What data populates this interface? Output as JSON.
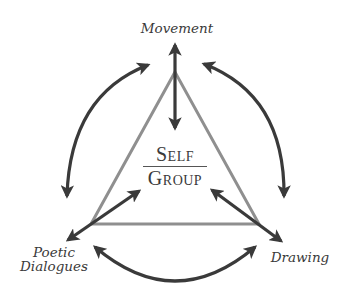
{
  "diagram": {
    "type": "triangle-cycle",
    "center": {
      "numerator": "Self",
      "denominator": "Group"
    },
    "nodes": [
      {
        "id": "top",
        "label": "Movement"
      },
      {
        "id": "bottom-left",
        "label_line1": "Poetic",
        "label_line2": "Dialogues"
      },
      {
        "id": "bottom-right",
        "label": "Drawing"
      }
    ],
    "connections": [
      {
        "from": "Movement",
        "to": "Self/Group",
        "kind": "double-arrow"
      },
      {
        "from": "Poetic Dialogues",
        "to": "Self/Group",
        "kind": "double-arrow"
      },
      {
        "from": "Drawing",
        "to": "Self/Group",
        "kind": "double-arrow"
      },
      {
        "from": "Movement",
        "to": "Poetic Dialogues",
        "kind": "curved-double-arrow"
      },
      {
        "from": "Movement",
        "to": "Drawing",
        "kind": "curved-double-arrow"
      },
      {
        "from": "Poetic Dialogues",
        "to": "Drawing",
        "kind": "curved-double-arrow"
      }
    ],
    "colors": {
      "arrow": "#3a3a3a",
      "triangle": "#8a8a8a",
      "text": "#3a3a3a",
      "background": "#ffffff"
    }
  }
}
